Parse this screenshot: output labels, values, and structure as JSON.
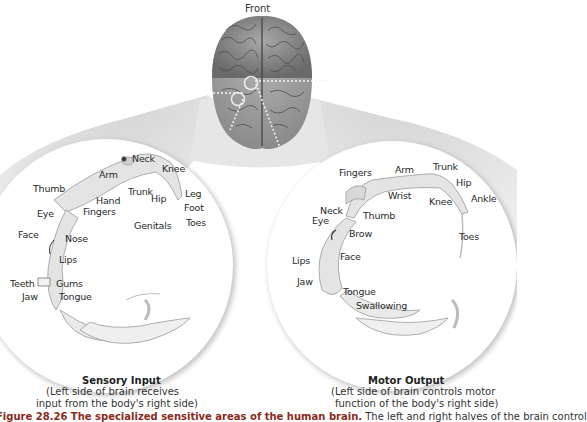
{
  "top": {
    "orientation_label": "Front"
  },
  "sensory": {
    "title": "Sensory Input",
    "subtitle_line1": "(Left side of brain receives",
    "subtitle_line2": "input from the body's right side)",
    "labels": {
      "neck": "Neck",
      "knee": "Knee",
      "arm": "Arm",
      "thumb": "Thumb",
      "trunk": "Trunk",
      "hip": "Hip",
      "leg": "Leg",
      "hand": "Hand",
      "foot": "Foot",
      "eye": "Eye",
      "fingers": "Fingers",
      "genitals": "Genitals",
      "toes": "Toes",
      "face": "Face",
      "nose": "Nose",
      "lips": "Lips",
      "teeth": "Teeth",
      "gums": "Gums",
      "jaw": "Jaw",
      "tongue": "Tongue"
    }
  },
  "motor": {
    "title": "Motor Output",
    "subtitle_line1": "(Left side of brain controls motor",
    "subtitle_line2": "function of the body's right side)",
    "labels": {
      "fingers": "Fingers",
      "arm": "Arm",
      "trunk": "Trunk",
      "hip": "Hip",
      "wrist": "Wrist",
      "knee": "Knee",
      "ankle": "Ankle",
      "neck": "Neck",
      "eye": "Eye",
      "thumb": "Thumb",
      "brow": "Brow",
      "toes": "Toes",
      "face": "Face",
      "lips": "Lips",
      "jaw": "Jaw",
      "tongue": "Tongue",
      "swallowing": "Swallowing"
    }
  },
  "caption": {
    "figure_label": "Figure 28.26 The specialized sensitive areas of the human brain.",
    "text": " The left and right halves of the brain control"
  },
  "colors": {
    "brain_gray": "#8e8e8e",
    "brain_dark": "#5a5a5a",
    "cone_gray": "#dcdcdc",
    "circle_bg": "#ffffff",
    "caption_accent": "#8a2a1a"
  }
}
